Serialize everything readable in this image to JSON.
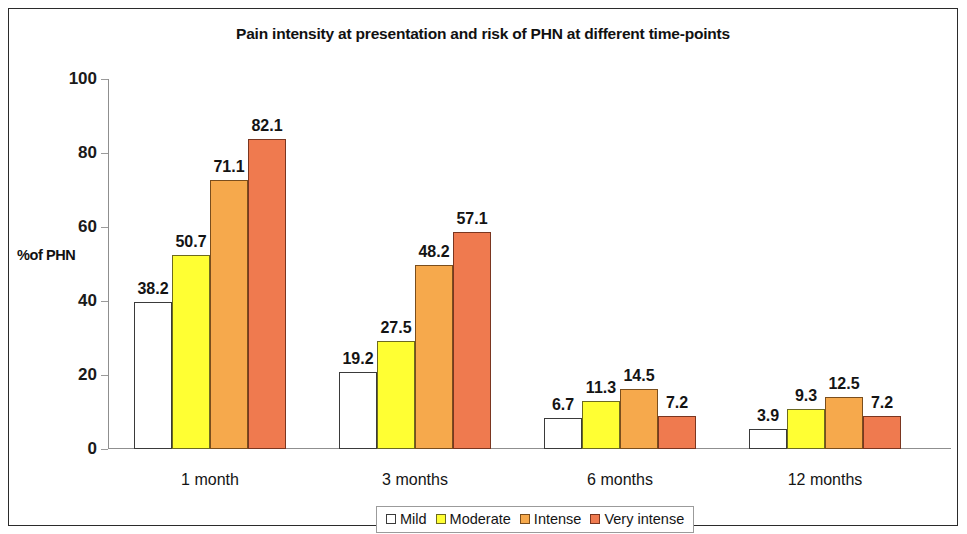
{
  "chart_data": {
    "type": "bar",
    "title": "Pain intensity at presentation and risk of PHN at different time-points",
    "xlabel": "",
    "ylabel": "%of PHN",
    "ylim": [
      0,
      100
    ],
    "ytick_step": 20,
    "yticks": [
      "0",
      "20",
      "40",
      "60",
      "80",
      "100"
    ],
    "grid": false,
    "legend_position": "bottom",
    "categories": [
      "1 month",
      "3 months",
      "6 months",
      "12 months"
    ],
    "series": [
      {
        "name": "Mild",
        "color": "#ffffff",
        "values": [
          38.2,
          19.2,
          6.7,
          3.9
        ]
      },
      {
        "name": "Moderate",
        "color": "#ffff33",
        "values": [
          50.7,
          27.5,
          11.3,
          9.3
        ]
      },
      {
        "name": "Intense",
        "color": "#f6a94c",
        "values": [
          71.1,
          48.2,
          14.5,
          12.5
        ]
      },
      {
        "name": "Very intense",
        "color": "#ef7a4f",
        "values": [
          82.1,
          57.1,
          7.2,
          7.2
        ]
      }
    ],
    "data_labels": [
      [
        "38.2",
        "50.7",
        "71.1",
        "82.1"
      ],
      [
        "19.2",
        "27.5",
        "48.2",
        "57.1"
      ],
      [
        "6.7",
        "11.3",
        "14.5",
        "7.2"
      ],
      [
        "3.9",
        "9.3",
        "12.5",
        "7.2"
      ]
    ]
  }
}
